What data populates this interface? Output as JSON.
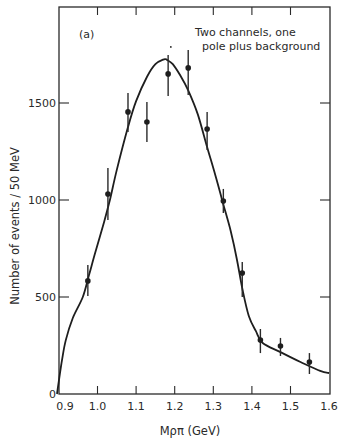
{
  "chart_data": {
    "type": "scatter",
    "panel_label": "(a)",
    "annotation": [
      "Two channels, one",
      "pole plus background"
    ],
    "xlabel": "Mρπ (GeV)",
    "ylabel": "Number of events / 50 MeV",
    "xlim": [
      0.89,
      1.6
    ],
    "ylim": [
      0,
      2000
    ],
    "x_ticks": [
      0.9,
      1.0,
      1.1,
      1.2,
      1.3,
      1.4,
      1.5,
      1.6
    ],
    "x_tick_labels": [
      "0.9",
      "1.0",
      "1.1",
      "1.2",
      "1.3",
      "1.4",
      "1.5",
      "1.6"
    ],
    "y_ticks": [
      0,
      500,
      1000,
      1500
    ],
    "y_tick_labels": [
      "0",
      "500",
      "1000",
      "1500"
    ],
    "grid": false,
    "legend": "none",
    "series": [
      {
        "name": "data",
        "style": "points-with-error-bars",
        "x": [
          0.975,
          1.027,
          1.079,
          1.128,
          1.183,
          1.235,
          1.284,
          1.326,
          1.375,
          1.422,
          1.474,
          1.549
        ],
        "y": [
          583,
          1031,
          1454,
          1402,
          1650,
          1681,
          1366,
          995,
          624,
          278,
          247,
          165
        ],
        "y_err_low": [
          505,
          897,
          1351,
          1299,
          1536,
          1541,
          1258,
          933,
          500,
          211,
          196,
          103
        ],
        "y_err_high": [
          665,
          1165,
          1552,
          1505,
          1748,
          1773,
          1454,
          1057,
          680,
          335,
          289,
          211
        ]
      },
      {
        "name": "fit: two channels, one pole plus background",
        "style": "line",
        "x": [
          0.895,
          0.908,
          0.918,
          0.936,
          0.962,
          0.978,
          0.996,
          1.017,
          1.032,
          1.05,
          1.079,
          1.1,
          1.128,
          1.15,
          1.172,
          1.18,
          1.195,
          1.215,
          1.235,
          1.26,
          1.284,
          1.305,
          1.325,
          1.345,
          1.361,
          1.376,
          1.392,
          1.41,
          1.428,
          1.474,
          1.526,
          1.577,
          1.6
        ],
        "y": [
          0,
          175,
          278,
          392,
          500,
          613,
          742,
          887,
          1000,
          1155,
          1376,
          1510,
          1634,
          1700,
          1725,
          1722,
          1700,
          1640,
          1565,
          1440,
          1273,
          1130,
          985,
          840,
          696,
          536,
          402,
          325,
          263,
          216,
          165,
          119,
          108
        ]
      }
    ],
    "extra_marks": [
      {
        "name": "small-dot-above-peak",
        "x": 1.19,
        "y": 1789
      }
    ]
  }
}
